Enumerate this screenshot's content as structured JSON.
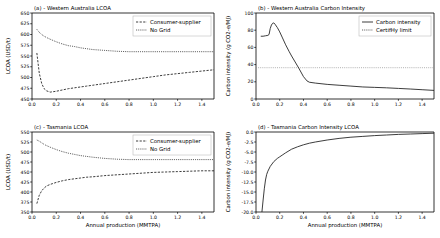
{
  "figure": {
    "xlabel": "Annual production (MMTPA)",
    "xticks": [
      "0.0",
      "0.2",
      "0.4",
      "0.6",
      "0.8",
      "1.0",
      "1.2",
      "1.4"
    ],
    "xlim": [
      0.0,
      1.5
    ]
  },
  "chart_data": [
    {
      "id": "panel-a",
      "type": "line",
      "title": "(a) - Western Australia LCOA",
      "xlabel": "",
      "ylabel": "LCOA (USD/t)",
      "xlim": [
        0.0,
        1.5
      ],
      "ylim": [
        450,
        650
      ],
      "xticks": [
        0.0,
        0.2,
        0.4,
        0.6,
        0.8,
        1.0,
        1.2,
        1.4
      ],
      "xticklabels": [
        "0.0",
        "0.2",
        "0.4",
        "0.6",
        "0.8",
        "1.0",
        "1.2",
        "1.4"
      ],
      "yticks": [
        450,
        475,
        500,
        525,
        550,
        575,
        600,
        625,
        650
      ],
      "yticklabels": [
        "450",
        "475",
        "500",
        "525",
        "550",
        "575",
        "600",
        "625",
        "650"
      ],
      "grid": false,
      "legend_position": "upper right",
      "x": [
        0.04,
        0.06,
        0.08,
        0.1,
        0.12,
        0.15,
        0.2,
        0.25,
        0.3,
        0.35,
        0.4,
        0.45,
        0.5,
        0.6,
        0.7,
        0.8,
        0.9,
        1.0,
        1.1,
        1.2,
        1.3,
        1.4,
        1.5
      ],
      "series": [
        {
          "name": "No Grid",
          "style": "dotted",
          "values": [
            612,
            605,
            600,
            596,
            593,
            589,
            583,
            578,
            574,
            572,
            569,
            567,
            565,
            563,
            561,
            560,
            560,
            560,
            560,
            560,
            560,
            560,
            560
          ]
        },
        {
          "name": "Consumer-supplier",
          "style": "dashed",
          "values": [
            557,
            510,
            486,
            474,
            469,
            466,
            468,
            471,
            474,
            476,
            478,
            480,
            482,
            486,
            490,
            494,
            498,
            502,
            506,
            509,
            512,
            515,
            518
          ]
        }
      ]
    },
    {
      "id": "panel-b",
      "type": "line",
      "title": "(b) - Western Australia Carbon Intensity",
      "xlabel": "",
      "ylabel": "Carbon intensity (g CO2-e/MJ)",
      "xlim": [
        0.0,
        1.5
      ],
      "ylim": [
        0,
        100
      ],
      "xticks": [
        0.0,
        0.2,
        0.4,
        0.6,
        0.8,
        1.0,
        1.2,
        1.4
      ],
      "xticklabels": [
        "0.0",
        "0.2",
        "0.4",
        "0.6",
        "0.8",
        "1.0",
        "1.2",
        "1.4"
      ],
      "yticks": [
        0,
        20,
        40,
        60,
        80,
        100
      ],
      "yticklabels": [
        "0",
        "20",
        "40",
        "60",
        "80",
        "100"
      ],
      "grid": false,
      "legend_position": "upper right",
      "x": [
        0.04,
        0.06,
        0.08,
        0.1,
        0.11,
        0.12,
        0.13,
        0.14,
        0.15,
        0.16,
        0.18,
        0.2,
        0.22,
        0.25,
        0.28,
        0.3,
        0.33,
        0.36,
        0.4,
        0.43,
        0.45,
        0.5,
        0.6,
        0.7,
        0.8,
        0.9,
        1.0,
        1.1,
        1.2,
        1.3,
        1.4,
        1.5
      ],
      "series": [
        {
          "name": "Carbon intensity",
          "style": "solid",
          "values": [
            73,
            73,
            73.5,
            74,
            75,
            82,
            86,
            88,
            88.5,
            87,
            83,
            78,
            72,
            63,
            55,
            50,
            43,
            36,
            26,
            21,
            19.5,
            18.5,
            17,
            16,
            15,
            14,
            13.5,
            13,
            12.3,
            11.6,
            10.8,
            10
          ]
        }
      ],
      "hlines": [
        {
          "name": "CertifHy limit",
          "style": "dotted",
          "value": 36.4
        }
      ]
    },
    {
      "id": "panel-c",
      "type": "line",
      "title": "(c) - Tasmania LCOA",
      "xlabel": "Annual production (MMTPA)",
      "ylabel": "LCOA (USD/t)",
      "xlim": [
        0.0,
        1.5
      ],
      "ylim": [
        350,
        550
      ],
      "xticks": [
        0.0,
        0.2,
        0.4,
        0.6,
        0.8,
        1.0,
        1.2,
        1.4
      ],
      "xticklabels": [
        "0.0",
        "0.2",
        "0.4",
        "0.6",
        "0.8",
        "1.0",
        "1.2",
        "1.4"
      ],
      "yticks": [
        350,
        375,
        400,
        425,
        450,
        475,
        500,
        525,
        550
      ],
      "yticklabels": [
        "350",
        "375",
        "400",
        "425",
        "450",
        "475",
        "500",
        "525",
        "550"
      ],
      "grid": false,
      "legend_position": "upper right",
      "x": [
        0.04,
        0.06,
        0.08,
        0.1,
        0.12,
        0.15,
        0.2,
        0.25,
        0.3,
        0.35,
        0.4,
        0.45,
        0.5,
        0.6,
        0.7,
        0.8,
        0.9,
        1.0,
        1.1,
        1.2,
        1.3,
        1.4,
        1.5
      ],
      "series": [
        {
          "name": "No Grid",
          "style": "dotted",
          "values": [
            530,
            527,
            523,
            519,
            516,
            512,
            506,
            501,
            497,
            494,
            491,
            489,
            487,
            484,
            482,
            481,
            481,
            481,
            481,
            481,
            481,
            481,
            481
          ]
        },
        {
          "name": "Consumer-supplier",
          "style": "dashed",
          "values": [
            371,
            392,
            403,
            410,
            415,
            419,
            424,
            428,
            431,
            433,
            435,
            437,
            438,
            441,
            443,
            445,
            447,
            449,
            450,
            451,
            452,
            453,
            453
          ]
        }
      ]
    },
    {
      "id": "panel-d",
      "type": "line",
      "title": "(d) - Tasmania Carbon Intensity LCOA",
      "xlabel": "Annual production (MMTPA)",
      "ylabel": "Carbon intensity (g CO2-e/MJ)",
      "xlim": [
        0.0,
        1.5
      ],
      "ylim": [
        -20.0,
        0.0
      ],
      "xticks": [
        0.0,
        0.2,
        0.4,
        0.6,
        0.8,
        1.0,
        1.2,
        1.4
      ],
      "xticklabels": [
        "0.0",
        "0.2",
        "0.4",
        "0.6",
        "0.8",
        "1.0",
        "1.2",
        "1.4"
      ],
      "yticks": [
        -20.0,
        -17.5,
        -15.0,
        -12.5,
        -10.0,
        -7.5,
        -5.0,
        -2.5,
        0.0
      ],
      "yticklabels": [
        "-20.0",
        "-17.5",
        "-15.0",
        "-12.5",
        "-10.0",
        "-7.5",
        "-5.0",
        "-2.5",
        "0.0"
      ],
      "grid": false,
      "legend_position": "none",
      "x": [
        0.05,
        0.06,
        0.07,
        0.08,
        0.09,
        0.1,
        0.12,
        0.15,
        0.18,
        0.2,
        0.22,
        0.25,
        0.3,
        0.35,
        0.4,
        0.45,
        0.5,
        0.6,
        0.7,
        0.8,
        0.9,
        1.0,
        1.1,
        1.2,
        1.3,
        1.4,
        1.5
      ],
      "series": [
        {
          "name": "Carbon intensity",
          "style": "solid",
          "values": [
            -20.0,
            -17.0,
            -14.2,
            -12.0,
            -10.6,
            -9.8,
            -8.6,
            -7.4,
            -6.6,
            -6.2,
            -5.8,
            -5.2,
            -4.3,
            -3.7,
            -3.2,
            -2.8,
            -2.5,
            -2.0,
            -1.6,
            -1.3,
            -1.1,
            -0.9,
            -0.75,
            -0.6,
            -0.5,
            -0.4,
            -0.3
          ]
        }
      ]
    }
  ],
  "legends": {
    "lcoa": [
      {
        "label": "Consumer-supplier",
        "style": "dashed"
      },
      {
        "label": "No Grid",
        "style": "dotted"
      }
    ],
    "carbon": [
      {
        "label": "Carbon intensity",
        "style": "solid"
      },
      {
        "label": "CertifHy limit",
        "style": "dotted"
      }
    ]
  }
}
